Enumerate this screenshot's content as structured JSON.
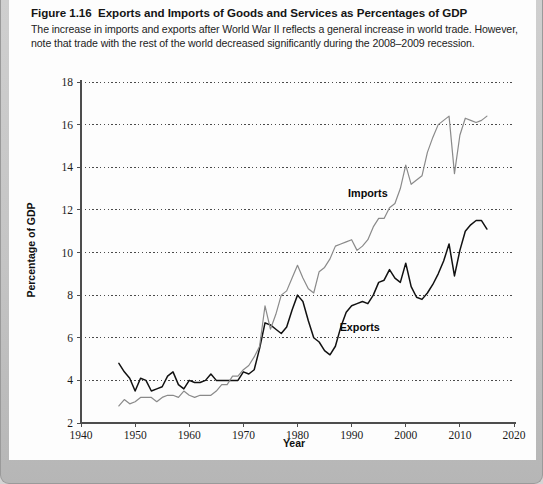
{
  "figure": {
    "number_label": "Figure 1.16",
    "title": "Exports and Imports of Goods and Services as Percentages of GDP",
    "caption": "The increase in imports and exports after World War II reflects a general increase in world trade. However, note that trade with the rest of the world decreased significantly during the 2008–2009 recession."
  },
  "colors": {
    "frame": "#c4c4c4",
    "panel": "#fdfdfd",
    "exports_line": "#111111",
    "imports_line": "#8a8a8a",
    "grid": "#4a4a4a",
    "axis": "#4d4d4d"
  },
  "chart_data": {
    "type": "line",
    "title": "Exports and Imports of Goods and Services as Percentages of GDP",
    "xlabel": "Year",
    "ylabel": "Percentage of GDP",
    "xlim": [
      1940,
      2020
    ],
    "ylim": [
      2,
      18
    ],
    "xticks": [
      1940,
      1950,
      1960,
      1970,
      1980,
      1990,
      2000,
      2010,
      2020
    ],
    "yticks": [
      2,
      4,
      6,
      8,
      10,
      12,
      14,
      16,
      18
    ],
    "grid": "horizontal-dotted",
    "legend": "inline-annotations",
    "annotations": [
      {
        "text": "Imports",
        "x": 1993.0,
        "y": 12.6
      },
      {
        "text": "Exports",
        "x": 1991.5,
        "y": 6.3
      }
    ],
    "x": [
      1947,
      1948,
      1949,
      1950,
      1951,
      1952,
      1953,
      1954,
      1955,
      1956,
      1957,
      1958,
      1959,
      1960,
      1961,
      1962,
      1963,
      1964,
      1965,
      1966,
      1967,
      1968,
      1969,
      1970,
      1971,
      1972,
      1973,
      1974,
      1975,
      1976,
      1977,
      1978,
      1979,
      1980,
      1981,
      1982,
      1983,
      1984,
      1985,
      1986,
      1987,
      1988,
      1989,
      1990,
      1991,
      1992,
      1993,
      1994,
      1995,
      1996,
      1997,
      1998,
      1999,
      2000,
      2001,
      2002,
      2003,
      2004,
      2005,
      2006,
      2007,
      2008,
      2009,
      2010,
      2011,
      2012,
      2013,
      2014,
      2015
    ],
    "series": [
      {
        "name": "Exports",
        "color": "#111111",
        "values": [
          4.8,
          4.4,
          4.1,
          3.5,
          4.1,
          4.0,
          3.5,
          3.6,
          3.7,
          4.2,
          4.4,
          3.8,
          3.6,
          4.0,
          3.9,
          3.9,
          4.0,
          4.3,
          4.0,
          4.0,
          4.0,
          4.0,
          4.0,
          4.4,
          4.3,
          4.5,
          5.5,
          6.7,
          6.6,
          6.4,
          6.2,
          6.5,
          7.3,
          8.0,
          7.7,
          6.8,
          6.0,
          5.8,
          5.4,
          5.2,
          5.6,
          6.5,
          7.2,
          7.5,
          7.6,
          7.7,
          7.6,
          8.0,
          8.6,
          8.7,
          9.2,
          8.8,
          8.6,
          9.5,
          8.4,
          7.9,
          7.8,
          8.1,
          8.5,
          9.0,
          9.6,
          10.4,
          8.9,
          10.1,
          11.0,
          11.3,
          11.5,
          11.5,
          11.1
        ],
        "final_value": 11.1
      },
      {
        "name": "Imports",
        "color": "#8a8a8a",
        "values": [
          2.8,
          3.1,
          2.9,
          3.0,
          3.2,
          3.2,
          3.2,
          3.0,
          3.2,
          3.3,
          3.3,
          3.2,
          3.5,
          3.3,
          3.2,
          3.3,
          3.3,
          3.3,
          3.5,
          3.8,
          3.8,
          4.2,
          4.2,
          4.5,
          4.7,
          5.1,
          5.6,
          7.5,
          6.4,
          7.1,
          8.0,
          8.2,
          8.8,
          9.4,
          8.8,
          8.3,
          8.1,
          9.1,
          9.3,
          9.7,
          10.3,
          10.4,
          10.5,
          10.6,
          10.1,
          10.3,
          10.6,
          11.2,
          11.6,
          11.6,
          12.1,
          12.3,
          13.0,
          14.1,
          13.2,
          13.4,
          13.6,
          14.7,
          15.4,
          16.0,
          16.2,
          16.4,
          13.7,
          15.5,
          16.3,
          16.2,
          16.1,
          16.2,
          16.4
        ],
        "final_value": 16.4
      }
    ]
  }
}
